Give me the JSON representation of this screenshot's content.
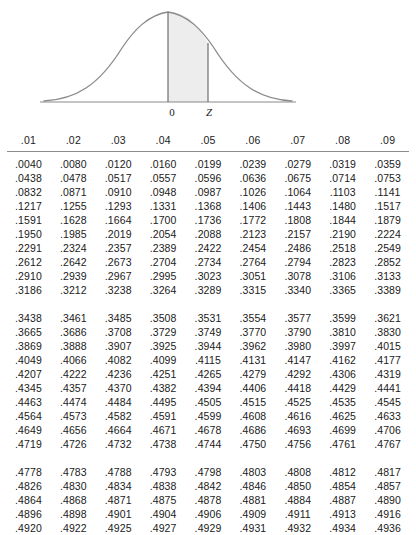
{
  "figure": {
    "name": "standard-normal-curve",
    "labels": {
      "zero": "0",
      "z": "Z"
    },
    "colors": {
      "curve": "#8a8a8a",
      "shade": "#ededed",
      "axis": "#8a8a8a"
    }
  },
  "table": {
    "title": "Standard Normal (Z) Table",
    "column_headers": [
      ".01",
      ".02",
      ".03",
      ".04",
      ".05",
      ".06",
      ".07",
      ".08",
      ".09"
    ],
    "blocks": [
      {
        "rows": [
          [
            ".0040",
            ".0080",
            ".0120",
            ".0160",
            ".0199",
            ".0239",
            ".0279",
            ".0319",
            ".0359"
          ],
          [
            ".0438",
            ".0478",
            ".0517",
            ".0557",
            ".0596",
            ".0636",
            ".0675",
            ".0714",
            ".0753"
          ],
          [
            ".0832",
            ".0871",
            ".0910",
            ".0948",
            ".0987",
            ".1026",
            ".1064",
            ".1103",
            ".1141"
          ],
          [
            ".1217",
            ".1255",
            ".1293",
            ".1331",
            ".1368",
            ".1406",
            ".1443",
            ".1480",
            ".1517"
          ],
          [
            ".1591",
            ".1628",
            ".1664",
            ".1700",
            ".1736",
            ".1772",
            ".1808",
            ".1844",
            ".1879"
          ],
          [
            ".1950",
            ".1985",
            ".2019",
            ".2054",
            ".2088",
            ".2123",
            ".2157",
            ".2190",
            ".2224"
          ],
          [
            ".2291",
            ".2324",
            ".2357",
            ".2389",
            ".2422",
            ".2454",
            ".2486",
            ".2518",
            ".2549"
          ],
          [
            ".2612",
            ".2642",
            ".2673",
            ".2704",
            ".2734",
            ".2764",
            ".2794",
            ".2823",
            ".2852"
          ],
          [
            ".2910",
            ".2939",
            ".2967",
            ".2995",
            ".3023",
            ".3051",
            ".3078",
            ".3106",
            ".3133"
          ],
          [
            ".3186",
            ".3212",
            ".3238",
            ".3264",
            ".3289",
            ".3315",
            ".3340",
            ".3365",
            ".3389"
          ]
        ]
      },
      {
        "rows": [
          [
            ".3438",
            ".3461",
            ".3485",
            ".3508",
            ".3531",
            ".3554",
            ".3577",
            ".3599",
            ".3621"
          ],
          [
            ".3665",
            ".3686",
            ".3708",
            ".3729",
            ".3749",
            ".3770",
            ".3790",
            ".3810",
            ".3830"
          ],
          [
            ".3869",
            ".3888",
            ".3907",
            ".3925",
            ".3944",
            ".3962",
            ".3980",
            ".3997",
            ".4015"
          ],
          [
            ".4049",
            ".4066",
            ".4082",
            ".4099",
            ".4115",
            ".4131",
            ".4147",
            ".4162",
            ".4177"
          ],
          [
            ".4207",
            ".4222",
            ".4236",
            ".4251",
            ".4265",
            ".4279",
            ".4292",
            ".4306",
            ".4319"
          ],
          [
            ".4345",
            ".4357",
            ".4370",
            ".4382",
            ".4394",
            ".4406",
            ".4418",
            ".4429",
            ".4441"
          ],
          [
            ".4463",
            ".4474",
            ".4484",
            ".4495",
            ".4505",
            ".4515",
            ".4525",
            ".4535",
            ".4545"
          ],
          [
            ".4564",
            ".4573",
            ".4582",
            ".4591",
            ".4599",
            ".4608",
            ".4616",
            ".4625",
            ".4633"
          ],
          [
            ".4649",
            ".4656",
            ".4664",
            ".4671",
            ".4678",
            ".4686",
            ".4693",
            ".4699",
            ".4706"
          ],
          [
            ".4719",
            ".4726",
            ".4732",
            ".4738",
            ".4744",
            ".4750",
            ".4756",
            ".4761",
            ".4767"
          ]
        ]
      },
      {
        "rows": [
          [
            ".4778",
            ".4783",
            ".4788",
            ".4793",
            ".4798",
            ".4803",
            ".4808",
            ".4812",
            ".4817"
          ],
          [
            ".4826",
            ".4830",
            ".4834",
            ".4838",
            ".4842",
            ".4846",
            ".4850",
            ".4854",
            ".4857"
          ],
          [
            ".4864",
            ".4868",
            ".4871",
            ".4875",
            ".4878",
            ".4881",
            ".4884",
            ".4887",
            ".4890"
          ],
          [
            ".4896",
            ".4898",
            ".4901",
            ".4904",
            ".4906",
            ".4909",
            ".4911",
            ".4913",
            ".4916"
          ],
          [
            ".4920",
            ".4922",
            ".4925",
            ".4927",
            ".4929",
            ".4931",
            ".4932",
            ".4934",
            ".4936"
          ]
        ]
      }
    ]
  }
}
